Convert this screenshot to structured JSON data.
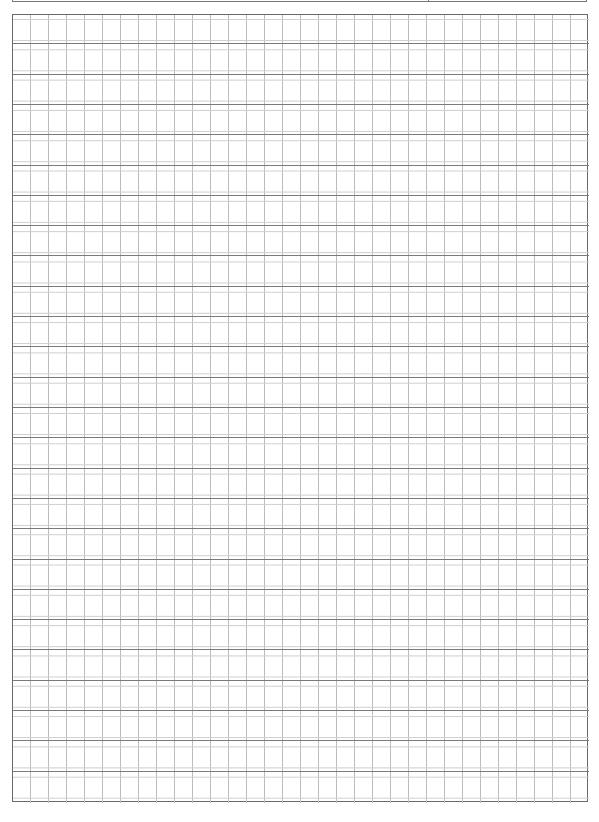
{
  "page": {
    "type": "graph-paper",
    "background": "#ffffff"
  },
  "header": {
    "cells": [
      "",
      ""
    ],
    "border_color": "#777777"
  },
  "grid": {
    "columns": 32,
    "bands": 26,
    "column_width_px": 18,
    "band_height_px": 30.3,
    "colors": {
      "border": "#6a6a6a",
      "vertical_line": "#bcbcbc",
      "major_horizontal": "#7a7a7a",
      "minor_horizontal": "#cfcfcf"
    }
  }
}
